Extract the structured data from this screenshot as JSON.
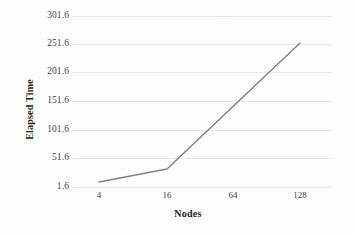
{
  "chart_data": {
    "type": "line",
    "title": "",
    "xlabel": "Nodes",
    "ylabel": "Elapsed Time",
    "x_tick_labels": [
      "4",
      "16",
      "64",
      "128"
    ],
    "y_tick_labels": [
      "1.6",
      "51.6",
      "101.6",
      "151.6",
      "201.6",
      "251.6",
      "301.6"
    ],
    "categories": [
      4,
      16,
      64,
      128
    ],
    "values": [
      13,
      41,
      146,
      252
    ],
    "series": [
      {
        "name": "Elapsed Time",
        "values": [
          13,
          41,
          146,
          252
        ],
        "color": "#808080"
      }
    ],
    "ylim": [
      1.6,
      301.6
    ],
    "y_tick_step": 50,
    "x_scale": "categorical",
    "grid": {
      "horizontal": true,
      "vertical": false,
      "color": "#e9e9e9"
    },
    "legend": {
      "visible": false,
      "position": "none"
    },
    "annotations": [],
    "axis_line_visible": false,
    "markers_visible": false,
    "line_width": 1.4
  },
  "axes": {
    "y_title": "Elapsed Time",
    "x_title": "Nodes"
  },
  "y_ticks": [
    {
      "label": "301.6",
      "value": 301.6,
      "y": 16
    },
    {
      "label": "251.6",
      "value": 251.6,
      "y": 44
    },
    {
      "label": "201.6",
      "value": 201.6,
      "y": 72
    },
    {
      "label": "151.6",
      "value": 151.6,
      "y": 101
    },
    {
      "label": "101.6",
      "value": 101.6,
      "y": 130
    },
    {
      "label": "51.6",
      "value": 51.6,
      "y": 158
    },
    {
      "label": "1.6",
      "value": 1.6,
      "y": 187
    }
  ],
  "x_ticks": [
    {
      "label": "4",
      "value": 4,
      "x": 99
    },
    {
      "label": "16",
      "value": 16,
      "x": 167
    },
    {
      "label": "64",
      "value": 64,
      "x": 233
    },
    {
      "label": "128",
      "value": 128,
      "x": 300
    }
  ],
  "series_points": [
    {
      "x": 99,
      "y": 182,
      "value": 13
    },
    {
      "x": 167,
      "y": 169,
      "value": 41
    },
    {
      "x": 300,
      "y": 43,
      "value": 252
    }
  ],
  "colors": {
    "line": "#808080",
    "grid": "#e9e9e9",
    "tick_text": "#454545",
    "axis_title_text": "#232323",
    "background": "#fdfdfd"
  }
}
